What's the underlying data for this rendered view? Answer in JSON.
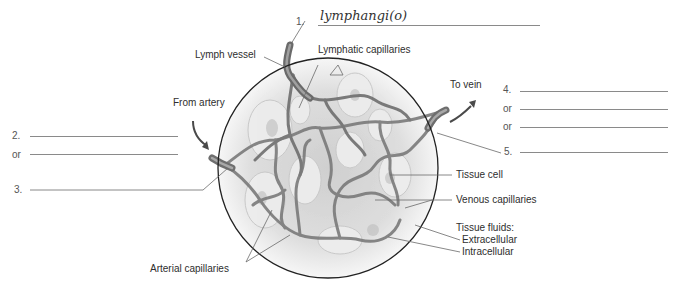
{
  "diagram": {
    "labels": {
      "lymph_vessel": "Lymph vessel",
      "lymphatic_capillaries": "Lymphatic capillaries",
      "from_artery": "From artery",
      "to_vein": "To vein",
      "tissue_cell": "Tissue cell",
      "venous_capillaries": "Venous capillaries",
      "tissue_fluids": "Tissue fluids:",
      "extracellular": "Extracellular",
      "intracellular": "Intracellular",
      "arterial_capillaries": "Arterial capillaries"
    },
    "blanks": {
      "b1": {
        "number": "1.",
        "answer": "lymphangi(o)"
      },
      "b2": {
        "number": "2.",
        "answer": ""
      },
      "b2_alt": {
        "number": "or",
        "answer": ""
      },
      "b3": {
        "number": "3.",
        "answer": ""
      },
      "b4": {
        "number": "4.",
        "answer": ""
      },
      "b4_alt1": {
        "number": "or",
        "answer": ""
      },
      "b4_alt2": {
        "number": "or",
        "answer": ""
      },
      "b5": {
        "number": "5.",
        "answer": ""
      }
    },
    "colors": {
      "vessel": "#7a7a7a",
      "circle": "#222222",
      "tissue": "#d9d9d9",
      "leader": "#6a6a6a"
    }
  }
}
